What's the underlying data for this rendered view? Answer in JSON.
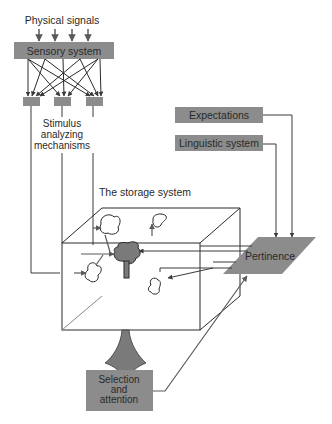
{
  "diagram": {
    "physical_signals": "Physical signals",
    "sensory_system": "Sensory system",
    "stimulus_line1": "Stimulus",
    "stimulus_line2": "analyzing",
    "stimulus_line3": "mechanisms",
    "storage_system": "The storage system",
    "expectations": "Expectations",
    "linguistic_system": "Linguistic system",
    "pertinence": "Pertinence",
    "selection_line1": "Selection",
    "selection_line2": "and",
    "selection_line3": "attention"
  },
  "colors": {
    "box_fill": "#8c8c8c",
    "line": "#3a3a3a",
    "text": "#2a2a2a",
    "background": "#ffffff"
  }
}
